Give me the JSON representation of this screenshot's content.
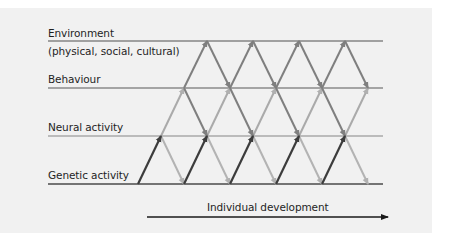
{
  "diagram": {
    "title": "",
    "levels": [
      {
        "id": "environment",
        "label": "Environment",
        "sublabel": "(physical, social, cultural)",
        "y": 41,
        "line_color": "#858585"
      },
      {
        "id": "behaviour",
        "label": "Behaviour",
        "y": 88,
        "line_color": "#8a8a8a"
      },
      {
        "id": "neural",
        "label": "Neural activity",
        "y": 136,
        "line_color": "#a9a9a9"
      },
      {
        "id": "genetic",
        "label": "Genetic activity",
        "y": 184,
        "line_color": "#4a4a4a"
      }
    ],
    "axis": {
      "label": "Individual development",
      "x_start": 147,
      "x_end": 388,
      "y": 217,
      "color": "#1a1a1a"
    },
    "arrow_colors": {
      "genetic_to_neural": "#3c3c3c",
      "neural_to_genetic": "#b3b3b3",
      "neural_to_behaviour": "#aaaaaa",
      "behaviour_to_neural": "#7f7f7f",
      "behaviour_to_environment": "#7f7f7f",
      "environment_to_behaviour": "#7f7f7f"
    },
    "line_extent": {
      "x_start": 48,
      "x_end": 383
    }
  }
}
